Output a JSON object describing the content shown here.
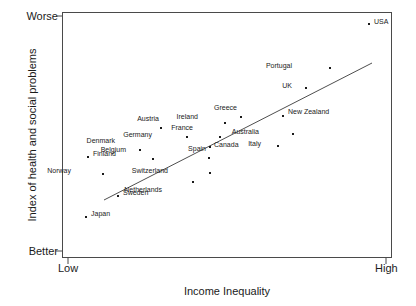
{
  "chart": {
    "type": "scatter",
    "title": "",
    "xlabel": "Income Inequality",
    "ylabel": "Index of health and social problems",
    "x_tick_labels": [
      "Low",
      "High"
    ],
    "y_tick_labels": [
      "Worse",
      "Better"
    ],
    "grid": false,
    "legend": "none",
    "axis_color": "#4a4a4a",
    "marker_color": "#1a1a1a",
    "trendline_color": "#3a3a3a"
  },
  "chart_data": {
    "type": "scatter",
    "title": "",
    "xlabel": "Income Inequality",
    "ylabel": "Index of health and social problems",
    "xlim": [
      0,
      1
    ],
    "ylim": [
      0,
      1
    ],
    "x_tick_labels": [
      "Low",
      "High"
    ],
    "y_tick_labels": [
      "Better",
      "Worse"
    ],
    "grid": false,
    "legend_position": "none",
    "point_label_field": "country",
    "points": [
      {
        "country": "Japan",
        "x": 0.073,
        "y": 0.174,
        "px": 86,
        "py": 217,
        "label_dx": 5,
        "label_dy": -3
      },
      {
        "country": "Sweden",
        "x": 0.17,
        "y": 0.254,
        "px": 118,
        "py": 196,
        "label_dx": 5,
        "label_dy": -3
      },
      {
        "country": "Norway",
        "x": 0.124,
        "y": 0.338,
        "px": 103,
        "py": 174,
        "label_dx": -32,
        "label_dy": -3
      },
      {
        "country": "Finland",
        "x": 0.079,
        "y": 0.403,
        "px": 88,
        "py": 157,
        "label_dx": 5,
        "label_dy": -3
      },
      {
        "country": "Belgium",
        "x": 0.276,
        "y": 0.395,
        "px": 153,
        "py": 159,
        "label_dx": -27,
        "label_dy": -9
      },
      {
        "country": "Netherlands",
        "x": 0.397,
        "y": 0.305,
        "px": 193,
        "py": 182,
        "label_dx": -31,
        "label_dy": 8
      },
      {
        "country": "Denmark",
        "x": 0.236,
        "y": 0.43,
        "px": 140,
        "py": 150,
        "label_dx": -25,
        "label_dy": -9
      },
      {
        "country": "Switzerland",
        "x": 0.449,
        "y": 0.338,
        "px": 210,
        "py": 173,
        "label_dx": -42,
        "label_dy": -2
      },
      {
        "country": "Germany",
        "x": 0.379,
        "y": 0.484,
        "px": 187,
        "py": 137,
        "label_dx": -35,
        "label_dy": -2
      },
      {
        "country": "Austria",
        "x": 0.3,
        "y": 0.52,
        "px": 161,
        "py": 128,
        "label_dx": -2,
        "label_dy": -9
      },
      {
        "country": "Spain",
        "x": 0.446,
        "y": 0.395,
        "px": 209,
        "py": 158,
        "label_dx": -3,
        "label_dy": -9
      },
      {
        "country": "Canada",
        "x": 0.449,
        "y": 0.439,
        "px": 210,
        "py": 147,
        "label_dx": 4,
        "label_dy": -2
      },
      {
        "country": "France",
        "x": 0.479,
        "y": 0.48,
        "px": 220,
        "py": 137,
        "label_dx": -27,
        "label_dy": -9
      },
      {
        "country": "Ireland",
        "x": 0.494,
        "y": 0.537,
        "px": 225,
        "py": 123,
        "label_dx": -27,
        "label_dy": -6
      },
      {
        "country": "Greece",
        "x": 0.543,
        "y": 0.561,
        "px": 241,
        "py": 117,
        "label_dx": -4,
        "label_dy": -9
      },
      {
        "country": "Italy",
        "x": 0.654,
        "y": 0.443,
        "px": 278,
        "py": 146,
        "label_dx": -17,
        "label_dy": -2
      },
      {
        "country": "Australia",
        "x": 0.701,
        "y": 0.492,
        "px": 293,
        "py": 134,
        "label_dx": -34,
        "label_dy": -2
      },
      {
        "country": "New Zealand",
        "x": 0.67,
        "y": 0.565,
        "px": 283,
        "py": 116,
        "label_dx": 5,
        "label_dy": -4
      },
      {
        "country": "UK",
        "x": 0.74,
        "y": 0.679,
        "px": 306,
        "py": 88,
        "label_dx": -14,
        "label_dy": -2
      },
      {
        "country": "Portugal",
        "x": 0.814,
        "y": 0.76,
        "px": 330,
        "py": 68,
        "label_dx": -38,
        "label_dy": -2
      },
      {
        "country": "USA",
        "x": 0.93,
        "y": 0.939,
        "px": 369,
        "py": 24,
        "label_dx": 5,
        "label_dy": -2
      }
    ],
    "trendline": {
      "label": "linear fit",
      "x1": 0.128,
      "y1": 0.235,
      "x2": 0.94,
      "y2": 0.793,
      "px1": 104,
      "py1": 200,
      "px2": 372,
      "py2": 63
    }
  }
}
